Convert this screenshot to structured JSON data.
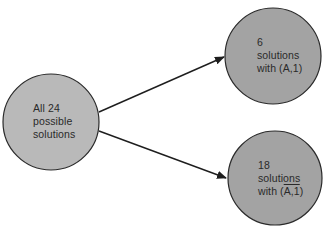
{
  "colors": {
    "background": "#ffffff",
    "source_fill": "#b9b9b9",
    "target_fill": "#a3a3a3",
    "stroke": "#2a2a2a",
    "text": "#2a2a2a"
  },
  "nodes": {
    "source": {
      "lines": [
        "All 24",
        "possible",
        "solutions"
      ]
    },
    "top": {
      "lines": [
        "6",
        "solutions",
        "with (A,1)"
      ]
    },
    "bottom": {
      "lines": [
        "18",
        "solutions"
      ],
      "line3_prefix": "with (",
      "line3_overlined": "A,1",
      "line3_suffix": ")"
    }
  },
  "edges": [
    {
      "from": "source",
      "to": "top"
    },
    {
      "from": "source",
      "to": "bottom"
    }
  ]
}
